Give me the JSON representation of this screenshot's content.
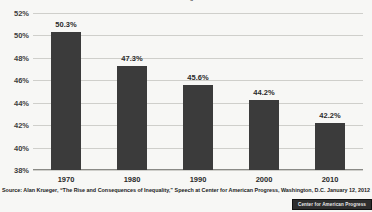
{
  "chart_data": {
    "type": "bar",
    "title": "Percent of Income Going to the Middle Class",
    "categories": [
      "1970",
      "1980",
      "1990",
      "2000",
      "2010"
    ],
    "values": [
      50.3,
      47.3,
      45.6,
      44.2,
      42.2
    ],
    "value_labels": [
      "50.3%",
      "47.3%",
      "45.6%",
      "44.2%",
      "42.2%"
    ],
    "xlabel": "",
    "ylabel": "",
    "ylim": [
      38,
      52
    ],
    "ytick_step": 2,
    "ytick_labels": [
      "52%",
      "50%",
      "48%",
      "46%",
      "44%",
      "42%",
      "40%",
      "38%"
    ],
    "ytick_values": [
      52,
      50,
      48,
      46,
      44,
      42,
      40,
      38
    ],
    "grid": true,
    "legend": "none",
    "bar_color": "#3b3b3b",
    "background_color": "#f7f7f5",
    "gridline_color": "#cfcfcb"
  },
  "source": {
    "note": "Source: Alan Krueger, “The Rise and Consequences of Inequality,” Speech at Center for American Progress, Washington, D.C. January 12, 2012"
  },
  "logo": {
    "label": "Center for American Progress"
  }
}
